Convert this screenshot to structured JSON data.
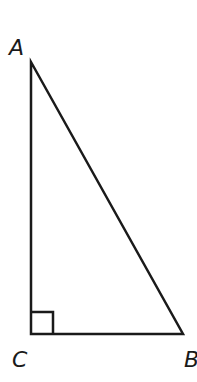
{
  "diagram": {
    "type": "right-triangle",
    "vertices": {
      "A": {
        "label": "A",
        "x": 31,
        "y": 62
      },
      "B": {
        "label": "B",
        "x": 183,
        "y": 334
      },
      "C": {
        "label": "C",
        "x": 31,
        "y": 334
      }
    },
    "right_angle_at": "C",
    "stroke_color": "#1a1a1a",
    "background": "#ffffff"
  }
}
